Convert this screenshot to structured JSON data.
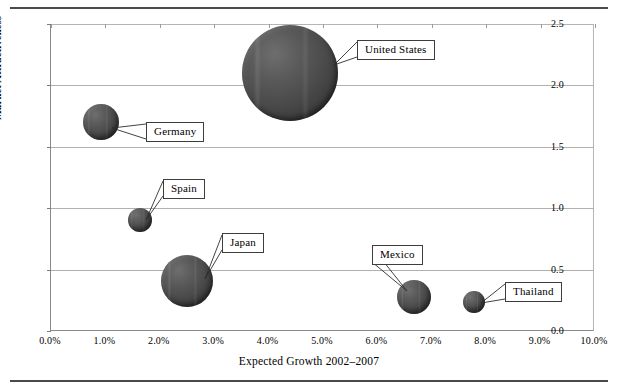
{
  "chart_data": {
    "type": "scatter",
    "title": "",
    "xlabel": "Expected Growth 2002–2007",
    "ylabel": "Market Attractiveness",
    "xlim": [
      0,
      10
    ],
    "ylim": [
      0,
      2.5
    ],
    "grid": true,
    "legend": "none",
    "x_tick_labels": [
      "0.0%",
      "1.0%",
      "2.0%",
      "3.0%",
      "4.0%",
      "5.0%",
      "6.0%",
      "7.0%",
      "8.0%",
      "9.0%",
      "10.0%"
    ],
    "x_tick_values": [
      0,
      1,
      2,
      3,
      4,
      5,
      6,
      7,
      8,
      9,
      10
    ],
    "y_tick_labels": [
      "0.0",
      "0.5",
      "1.0",
      "1.5",
      "2.0",
      "2.5"
    ],
    "y_tick_values": [
      0,
      0.5,
      1.0,
      1.5,
      2.0,
      2.5
    ],
    "bubble_color": "#4a4a4a",
    "points": [
      {
        "label": "United States",
        "x": 4.4,
        "y": 2.1,
        "r_px": 48,
        "size_rank": 1,
        "callout": {
          "left": 357,
          "top": 40,
          "anchor_x": 334,
          "anchor_y": 65
        }
      },
      {
        "label": "Germany",
        "x": 0.92,
        "y": 1.7,
        "r_px": 18,
        "size_rank": 4,
        "callout": {
          "left": 146,
          "top": 122,
          "anchor_x": 112,
          "anchor_y": 128
        }
      },
      {
        "label": "Spain",
        "x": 1.64,
        "y": 0.9,
        "r_px": 12,
        "size_rank": 5,
        "callout": {
          "left": 163,
          "top": 179,
          "anchor_x": 146,
          "anchor_y": 220
        }
      },
      {
        "label": "Japan",
        "x": 2.5,
        "y": 0.41,
        "r_px": 26,
        "size_rank": 2,
        "callout": {
          "left": 222,
          "top": 233,
          "anchor_x": 205,
          "anchor_y": 279
        }
      },
      {
        "label": "Mexico",
        "x": 6.68,
        "y": 0.28,
        "r_px": 17,
        "size_rank": 3,
        "callout": {
          "left": 372,
          "top": 245,
          "anchor_x": 407,
          "anchor_y": 291
        }
      },
      {
        "label": "Thailand",
        "x": 7.78,
        "y": 0.24,
        "r_px": 11,
        "size_rank": 6,
        "callout": {
          "left": 505,
          "top": 282,
          "anchor_x": 481,
          "anchor_y": 303
        }
      }
    ]
  }
}
